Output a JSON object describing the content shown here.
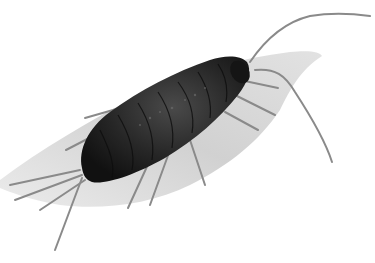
{
  "image": {
    "subject": "sea slater isopod illustration",
    "style": "grayscale pencil drawing",
    "colors": {
      "background": "#ffffff",
      "body": "#1f1f1f",
      "body_highlight": "#4a4a4a",
      "shadow": "#c9c9c9",
      "legs": "#8a8a8a"
    }
  }
}
